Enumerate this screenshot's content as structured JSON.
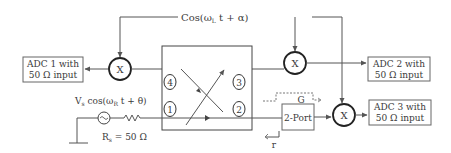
{
  "diagram": {
    "lo_signal": "Cos(ω",
    "lo_signal_sub": "L",
    "lo_signal_tail": " t + α)",
    "adc1": {
      "line1": "ADC 1 with",
      "line2": "50 Ω input"
    },
    "adc2": {
      "line1": "ADC 2 with",
      "line2": "50 Ω input"
    },
    "adc3": {
      "line1": "ADC 3 with",
      "line2": "50 Ω input"
    },
    "mixer_label": "X",
    "coupler_ports": [
      "1",
      "2",
      "3",
      "4"
    ],
    "source": {
      "label_v": "V",
      "label_v_sub": "s",
      "label_mid": " cos(ω",
      "label_w_sub": "R",
      "label_tail": " t + θ)",
      "resistor_r": "R",
      "resistor_r_sub": "s",
      "resistor_value": " = 50 Ω"
    },
    "two_port_label": "2-Port",
    "gain_label": "G",
    "reflection_label": "r"
  }
}
